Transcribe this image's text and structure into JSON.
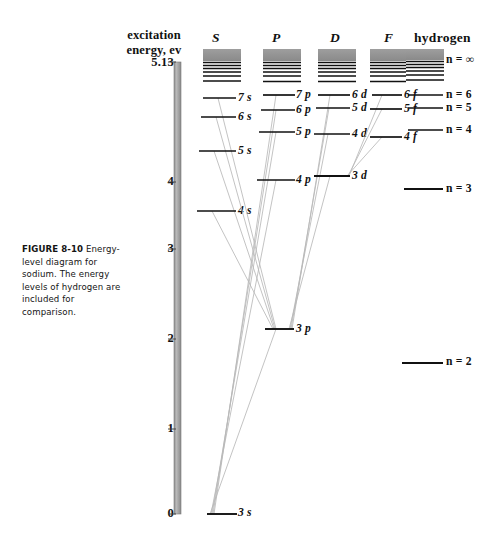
{
  "figure": {
    "caption_bold": "FIGURE 8-10",
    "caption_text": "Energy-level diagram for sodium. The energy levels of hydrogen are included for comparison.",
    "axis_title_line1": "excitation",
    "axis_title_line2": "energy, ev",
    "axis_color": "#9a9a9a",
    "level_color": "#111111",
    "transition_color": "#b4b4b4",
    "continuum_color": "#8c8c8c"
  },
  "axis": {
    "unit": "ev",
    "min": 0,
    "max": 5.13,
    "ticks": [
      {
        "label": "5.13",
        "value": 5.13
      },
      {
        "label": "4",
        "value": 4
      },
      {
        "label": "3",
        "value": 3
      },
      {
        "label": "2",
        "value": 2
      },
      {
        "label": "1",
        "value": 1
      },
      {
        "label": "0",
        "value": 0
      }
    ]
  },
  "columns": [
    {
      "id": "S",
      "header": "S"
    },
    {
      "id": "P",
      "header": "P"
    },
    {
      "id": "D",
      "header": "D"
    },
    {
      "id": "F",
      "header": "F"
    },
    {
      "id": "H",
      "header": "hydrogen"
    }
  ],
  "levels": {
    "S": [
      {
        "label": "7 s",
        "term": "7s",
        "energy": 4.51
      },
      {
        "label": "6 s",
        "term": "6s",
        "energy": 4.29
      },
      {
        "label": "5 s",
        "term": "5s",
        "energy": 3.89
      },
      {
        "label": "4 s",
        "term": "4s",
        "energy": 3.19
      }
    ],
    "P": [
      {
        "label": "7 p",
        "term": "7p",
        "energy": 4.55
      },
      {
        "label": "6 p",
        "term": "6p",
        "energy": 4.37
      },
      {
        "label": "5 p",
        "term": "5p",
        "energy": 4.11
      },
      {
        "label": "4 p",
        "term": "4p",
        "energy": 3.58
      },
      {
        "label": "3 p",
        "term": "3p",
        "energy": 2.1
      }
    ],
    "D": [
      {
        "label": "6 d",
        "term": "6d",
        "energy": 4.55
      },
      {
        "label": "5 d",
        "term": "5d",
        "energy": 4.4
      },
      {
        "label": "4 d",
        "term": "4d",
        "energy": 4.1
      },
      {
        "label": "3 d",
        "term": "3d",
        "energy": 3.61
      }
    ],
    "F": [
      {
        "label": "6 f",
        "term": "6f",
        "energy": 4.55
      },
      {
        "label": "5 f",
        "term": "5f",
        "energy": 4.39
      },
      {
        "label": "4 f",
        "term": "4f",
        "energy": 4.05
      }
    ],
    "H": [
      {
        "label": "n = ∞",
        "term": "n=inf",
        "energy": 5.13
      },
      {
        "label": "n = 6",
        "term": "n=6",
        "energy": 4.55
      },
      {
        "label": "n = 5",
        "term": "n=5",
        "energy": 4.4
      },
      {
        "label": "n = 4",
        "term": "n=4",
        "energy": 4.08
      },
      {
        "label": "n = 3",
        "term": "n=3",
        "energy": 3.48
      },
      {
        "label": "n = 2",
        "term": "n=2",
        "energy": 2.22
      }
    ]
  },
  "ground_level": {
    "label": "3 s",
    "term": "3s",
    "energy": 0.0
  },
  "transitions": [
    {
      "from": "P:7p",
      "to": "S:3s"
    },
    {
      "from": "P:6p",
      "to": "S:3s"
    },
    {
      "from": "P:5p",
      "to": "S:3s"
    },
    {
      "from": "P:4p",
      "to": "S:3s"
    },
    {
      "from": "P:3p",
      "to": "S:3s"
    },
    {
      "from": "S:7s",
      "to": "P:3p"
    },
    {
      "from": "S:6s",
      "to": "P:3p"
    },
    {
      "from": "S:5s",
      "to": "P:3p"
    },
    {
      "from": "S:4s",
      "to": "P:3p"
    },
    {
      "from": "D:6d",
      "to": "P:3p"
    },
    {
      "from": "D:5d",
      "to": "P:3p"
    },
    {
      "from": "D:4d",
      "to": "P:3p"
    },
    {
      "from": "D:3d",
      "to": "P:3p"
    },
    {
      "from": "F:6f",
      "to": "D:3d"
    },
    {
      "from": "F:5f",
      "to": "D:3d"
    },
    {
      "from": "F:4f",
      "to": "D:3d"
    }
  ],
  "continuum": {
    "note": "shaded ionization continuum with converging Rydberg lines at top of each column"
  }
}
